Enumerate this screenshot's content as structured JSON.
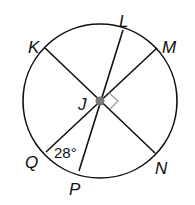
{
  "diagram": {
    "type": "circle-with-diameters",
    "center": {
      "label": "J",
      "x": 100,
      "y": 101
    },
    "radius": 77,
    "points": [
      {
        "label": "K",
        "x": 45,
        "y": 48,
        "lx": 30,
        "ly": 52
      },
      {
        "label": "L",
        "x": 123,
        "y": 30,
        "lx": 120,
        "ly": 26
      },
      {
        "label": "M",
        "x": 157,
        "y": 48,
        "lx": 162,
        "ly": 52
      },
      {
        "label": "N",
        "x": 155,
        "y": 153,
        "lx": 156,
        "ly": 175
      },
      {
        "label": "P",
        "x": 79,
        "y": 171,
        "lx": 70,
        "ly": 195
      },
      {
        "label": "Q",
        "x": 46,
        "y": 152,
        "lx": 25,
        "ly": 168
      }
    ],
    "segments": [
      [
        "K",
        "N"
      ],
      [
        "L",
        "P"
      ],
      [
        "M",
        "Q"
      ]
    ],
    "center_label": {
      "text": "J",
      "x": 78,
      "y": 110
    },
    "angle_label": {
      "text": "28°",
      "x": 56,
      "y": 157
    },
    "right_angle_marker": {
      "at": "J",
      "between": [
        "M",
        "N"
      ],
      "color": "#999999"
    },
    "line_color": "#111111",
    "dot_color": "#777777"
  }
}
